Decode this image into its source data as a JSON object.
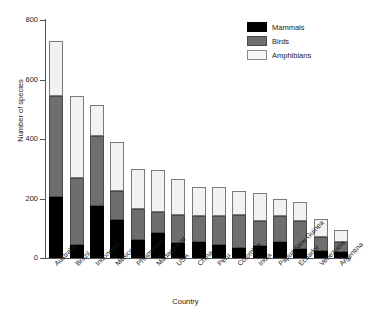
{
  "chart_data": {
    "type": "bar",
    "stacked": true,
    "title": "",
    "xlabel": "Country",
    "ylabel": "Number of species",
    "ylim": [
      0,
      800
    ],
    "yticks": [
      0,
      200,
      400,
      600,
      800
    ],
    "grid": false,
    "legend_position": "top-right",
    "categories": [
      "Australia",
      "Brazil",
      "Indonesia",
      "Mexico",
      "Philippines",
      "Madagascar",
      "USA",
      "China",
      "Peru",
      "Colombia",
      "India",
      "Papua New Guinea",
      "Ecuador",
      "Venezuela",
      "Argentina"
    ],
    "series": [
      {
        "name": "Mammals",
        "color": "#000000",
        "values": [
          205,
          45,
          175,
          128,
          60,
          85,
          50,
          55,
          45,
          35,
          40,
          55,
          30,
          25,
          20
        ]
      },
      {
        "name": "Birds",
        "color": "#6e6e6e",
        "values": [
          340,
          225,
          235,
          97,
          105,
          70,
          95,
          85,
          95,
          110,
          85,
          85,
          95,
          45,
          35
        ]
      },
      {
        "name": "Amphibians",
        "color": "#f2f2f2",
        "values": [
          185,
          275,
          105,
          165,
          135,
          140,
          120,
          100,
          100,
          80,
          95,
          60,
          65,
          60,
          40
        ]
      }
    ],
    "totals": [
      730,
      545,
      515,
      390,
      300,
      295,
      265,
      240,
      240,
      225,
      220,
      200,
      190,
      130,
      95
    ]
  },
  "legend": {
    "items": [
      {
        "label": "Mammals"
      },
      {
        "label": "Birds"
      },
      {
        "label": "Amphibians"
      }
    ]
  }
}
